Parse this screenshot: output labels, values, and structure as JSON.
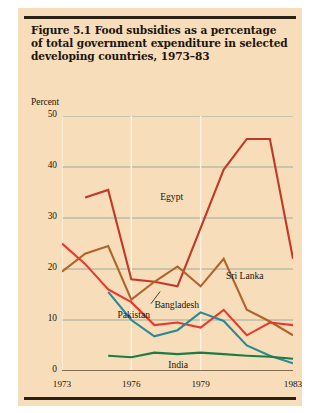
{
  "figure": {
    "number": "Figure 5.1",
    "title_lines": [
      "Figure 5.1  Food subsidies as a percentage",
      "of total government expenditure in selected",
      "developing countries, 1973–83"
    ],
    "axis_unit_label": "Percent",
    "background_color": "#f7ddba",
    "rule_color": "#2b2117"
  },
  "chart_data": {
    "type": "line",
    "title": "Figure 5.1  Food subsidies as a percentage of total government expenditure in selected developing countries, 1973–83",
    "xlabel": "",
    "ylabel": "Percent",
    "ylim": [
      0,
      50
    ],
    "xlim": [
      1973,
      1983
    ],
    "yticks": [
      0,
      10,
      20,
      30,
      40,
      50
    ],
    "xticks": [
      1973,
      1976,
      1979,
      1983
    ],
    "xtick_labels": [
      "1973",
      "1976",
      "1979",
      "1983"
    ],
    "grid": "horizontal-and-vertical",
    "gridline_color_horizontal": "#8aa99a",
    "gridline_color_vertical": "#fdf3e2",
    "legend": "inline-labels",
    "x": [
      1973,
      1974,
      1975,
      1976,
      1977,
      1978,
      1979,
      1980,
      1981,
      1982,
      1983
    ],
    "series": [
      {
        "name": "Egypt",
        "color": "#c0392b",
        "label_x": 1977.25,
        "label_y": 34.0,
        "values": [
          null,
          34.0,
          35.5,
          18.0,
          17.5,
          16.6,
          28.0,
          39.5,
          45.5,
          45.5,
          22.0
        ]
      },
      {
        "name": "Sri Lanka",
        "color": "#b0642a",
        "label_x": 1980.1,
        "label_y": 18.4,
        "values": [
          19.5,
          23.0,
          24.5,
          14.0,
          17.5,
          20.5,
          16.6,
          22.0,
          12.0,
          9.7,
          7.0
        ]
      },
      {
        "name": "Bangladesh",
        "color": "#e8392c",
        "label_x": 1977.0,
        "label_y": 12.7,
        "values": [
          25.0,
          21.0,
          16.0,
          13.5,
          9.0,
          9.5,
          8.5,
          12.0,
          7.0,
          9.5,
          9.0
        ]
      },
      {
        "name": "Pakistan",
        "color": "#2a8a92",
        "label_x": 1975.4,
        "label_y": 10.8,
        "values": [
          null,
          null,
          15.5,
          10.0,
          6.8,
          8.0,
          11.5,
          9.8,
          5.0,
          3.0,
          1.5
        ]
      },
      {
        "name": "India",
        "color": "#1e7b45",
        "label_x": 1977.6,
        "label_y": 1.0,
        "values": [
          null,
          null,
          3.0,
          2.7,
          3.6,
          3.3,
          3.6,
          3.3,
          3.0,
          2.8,
          2.4
        ]
      }
    ]
  },
  "series_labels": [
    {
      "key": "egypt",
      "text": "Egypt"
    },
    {
      "key": "sri_lanka",
      "text": "Sri Lanka"
    },
    {
      "key": "bangladesh",
      "text": "Bangladesh"
    },
    {
      "key": "pakistan",
      "text": "Pakistan"
    },
    {
      "key": "india",
      "text": "India"
    }
  ],
  "y_tick_labels": [
    "50",
    "40",
    "30",
    "20",
    "10",
    "0"
  ],
  "x_tick_labels": [
    "1973",
    "1976",
    "1979",
    "1983"
  ]
}
